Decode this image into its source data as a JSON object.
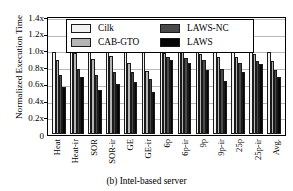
{
  "chart_data": {
    "type": "bar",
    "title": "",
    "caption": "(b) Intel-based server",
    "xlabel": "",
    "ylabel": "Normalized Execution Time",
    "categories": [
      "Heat",
      "Heat-ir",
      "SOR",
      "SOR-ir",
      "GE",
      "GE-ir",
      "6p",
      "6p-ir",
      "9p",
      "9p-ir",
      "25p",
      "25p-ir",
      "Avg."
    ],
    "series": [
      {
        "name": "Cilk",
        "color": "#f2f2f2",
        "values": [
          1.0,
          1.0,
          1.0,
          1.0,
          1.0,
          1.0,
          1.0,
          1.0,
          1.0,
          1.0,
          1.0,
          1.0,
          1.0
        ]
      },
      {
        "name": "CAB-GTO",
        "color": "#b5b5b5",
        "values": [
          0.9,
          0.99,
          0.91,
          0.95,
          0.86,
          0.77,
          0.99,
          1.0,
          0.98,
          0.94,
          0.94,
          0.98,
          0.89
        ]
      },
      {
        "name": "LAWS-NC",
        "color": "#4a4a4a",
        "values": [
          0.72,
          0.79,
          0.72,
          0.76,
          0.76,
          0.67,
          0.94,
          0.92,
          0.9,
          0.79,
          0.87,
          0.89,
          0.78
        ]
      },
      {
        "name": "LAWS",
        "color": "#060606",
        "values": [
          0.57,
          0.69,
          0.54,
          0.61,
          0.63,
          0.51,
          0.9,
          0.87,
          0.78,
          0.64,
          0.75,
          0.85,
          0.7
        ]
      }
    ],
    "ylim": [
      0,
      1.4
    ],
    "yticks": [
      "1.4x",
      "1.2x",
      "1.0x",
      "0.8x",
      "0.6x",
      "0.4x",
      "0.2x"
    ],
    "ytick_values": [
      1.4,
      1.2,
      1.0,
      0.8,
      0.6,
      0.4,
      0.2
    ],
    "y_zero_label": "0",
    "grid": true,
    "legend_position": "upper-center",
    "legend_entries": [
      "Cilk",
      "LAWS-NC",
      "CAB-GTO",
      "LAWS"
    ]
  }
}
